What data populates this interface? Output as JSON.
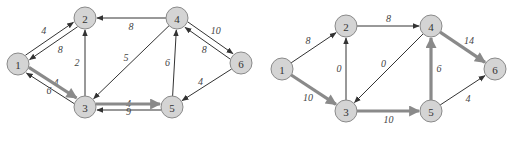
{
  "colors": {
    "node_fill": "#d4d4d4",
    "node_stroke": "#8a8a8a",
    "thin_edge": "#333333",
    "thick_edge": "#8a8a8a",
    "background": "#ffffff"
  },
  "node_radius": 11,
  "graphs": [
    {
      "id": "left",
      "nodes": [
        {
          "id": "1",
          "label": "1",
          "x": 18,
          "y": 64
        },
        {
          "id": "2",
          "label": "2",
          "x": 85,
          "y": 18
        },
        {
          "id": "3",
          "label": "3",
          "x": 85,
          "y": 107
        },
        {
          "id": "4",
          "label": "4",
          "x": 177,
          "y": 18
        },
        {
          "id": "5",
          "label": "5",
          "x": 172,
          "y": 107
        },
        {
          "id": "6",
          "label": "6",
          "x": 241,
          "y": 63
        }
      ],
      "edges": [
        {
          "from": "1",
          "to": "2",
          "weight": "4",
          "thick": false,
          "offset": -3,
          "label_dx": -6,
          "label_dy": -8
        },
        {
          "from": "2",
          "to": "1",
          "weight": "8",
          "thick": false,
          "offset": -3,
          "label_dx": 7,
          "label_dy": 6
        },
        {
          "from": "3",
          "to": "1",
          "weight": "4",
          "thick": false,
          "offset": -3,
          "label_dx": 6,
          "label_dy": -6
        },
        {
          "from": "1",
          "to": "3",
          "weight": "6",
          "thick": true,
          "offset": -3,
          "label_dx": -4,
          "label_dy": 8
        },
        {
          "from": "3",
          "to": "2",
          "weight": "2",
          "thick": false,
          "offset": 0,
          "label_dx": -8,
          "label_dy": 0
        },
        {
          "from": "4",
          "to": "2",
          "weight": "8",
          "thick": false,
          "offset": 0,
          "label_dx": 0,
          "label_dy": 8
        },
        {
          "from": "4",
          "to": "3",
          "weight": "5",
          "thick": false,
          "offset": 0,
          "label_dx": -5,
          "label_dy": -5
        },
        {
          "from": "5",
          "to": "4",
          "weight": "6",
          "thick": false,
          "offset": 0,
          "label_dx": -7,
          "label_dy": 0
        },
        {
          "from": "4",
          "to": "6",
          "weight": "10",
          "thick": false,
          "offset": -3,
          "label_dx": 5,
          "label_dy": -8
        },
        {
          "from": "6",
          "to": "4",
          "weight": "8",
          "thick": false,
          "offset": -3,
          "label_dx": -3,
          "label_dy": 7
        },
        {
          "from": "6",
          "to": "5",
          "weight": "4",
          "thick": false,
          "offset": 0,
          "label_dx": -6,
          "label_dy": -4
        },
        {
          "from": "5",
          "to": "3",
          "weight": "4",
          "thick": false,
          "offset": -3,
          "label_dx": 0,
          "label_dy": -7
        },
        {
          "from": "3",
          "to": "5",
          "weight": "9",
          "thick": true,
          "offset": -3,
          "label_dx": 0,
          "label_dy": 7
        }
      ]
    },
    {
      "id": "right",
      "nodes": [
        {
          "id": "1",
          "label": "1",
          "x": 282,
          "y": 69
        },
        {
          "id": "2",
          "label": "2",
          "x": 346,
          "y": 26
        },
        {
          "id": "3",
          "label": "3",
          "x": 346,
          "y": 111
        },
        {
          "id": "4",
          "label": "4",
          "x": 431,
          "y": 26
        },
        {
          "id": "5",
          "label": "5",
          "x": 431,
          "y": 111
        },
        {
          "id": "6",
          "label": "6",
          "x": 495,
          "y": 69
        }
      ],
      "edges": [
        {
          "from": "1",
          "to": "2",
          "weight": "8",
          "thick": false,
          "offset": 0,
          "label_dx": -6,
          "label_dy": -7
        },
        {
          "from": "1",
          "to": "3",
          "weight": "10",
          "thick": true,
          "offset": 0,
          "label_dx": -6,
          "label_dy": 7
        },
        {
          "from": "3",
          "to": "2",
          "weight": "0",
          "thick": false,
          "offset": 0,
          "label_dx": -7,
          "label_dy": 0
        },
        {
          "from": "2",
          "to": "4",
          "weight": "8",
          "thick": false,
          "offset": 0,
          "label_dx": 0,
          "label_dy": -8
        },
        {
          "from": "4",
          "to": "3",
          "weight": "0",
          "thick": false,
          "offset": 0,
          "label_dx": -5,
          "label_dy": -5
        },
        {
          "from": "3",
          "to": "5",
          "weight": "10",
          "thick": true,
          "offset": 0,
          "label_dx": 0,
          "label_dy": 8
        },
        {
          "from": "5",
          "to": "4",
          "weight": "6",
          "thick": true,
          "offset": 0,
          "label_dx": 8,
          "label_dy": 0
        },
        {
          "from": "4",
          "to": "6",
          "weight": "14",
          "thick": true,
          "offset": 0,
          "label_dx": 6,
          "label_dy": -7
        },
        {
          "from": "5",
          "to": "6",
          "weight": "4",
          "thick": false,
          "offset": 0,
          "label_dx": 5,
          "label_dy": 8
        }
      ]
    }
  ]
}
